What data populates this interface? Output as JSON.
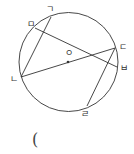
{
  "diagram": {
    "type": "circle-geometry",
    "colors": {
      "stroke": "#333333",
      "text": "#333333",
      "background": "#ffffff"
    },
    "circle": {
      "cx": 68.5,
      "cy": 62,
      "r": 49.5,
      "center_label": "ㅇ"
    },
    "points": [
      {
        "id": "g",
        "label": "ㄱ",
        "x": 51,
        "y": 17
      },
      {
        "id": "m",
        "label": "ㅁ",
        "x": 35,
        "y": 28
      },
      {
        "id": "n",
        "label": "ㄴ",
        "x": 21,
        "y": 77
      },
      {
        "id": "d",
        "label": "ㄷ",
        "x": 115,
        "y": 48
      },
      {
        "id": "b",
        "label": "ㅂ",
        "x": 117,
        "y": 67
      },
      {
        "id": "r",
        "label": "ㄹ",
        "x": 87,
        "y": 106
      }
    ],
    "segments": [
      {
        "from": "ㄱ",
        "to": "ㄴ"
      },
      {
        "from": "ㄴ",
        "to": "ㄷ",
        "through_center": true
      },
      {
        "from": "ㄷ",
        "to": "ㄹ"
      },
      {
        "from": "ㅁ",
        "to": "ㅂ"
      }
    ],
    "answer_blank": "("
  }
}
